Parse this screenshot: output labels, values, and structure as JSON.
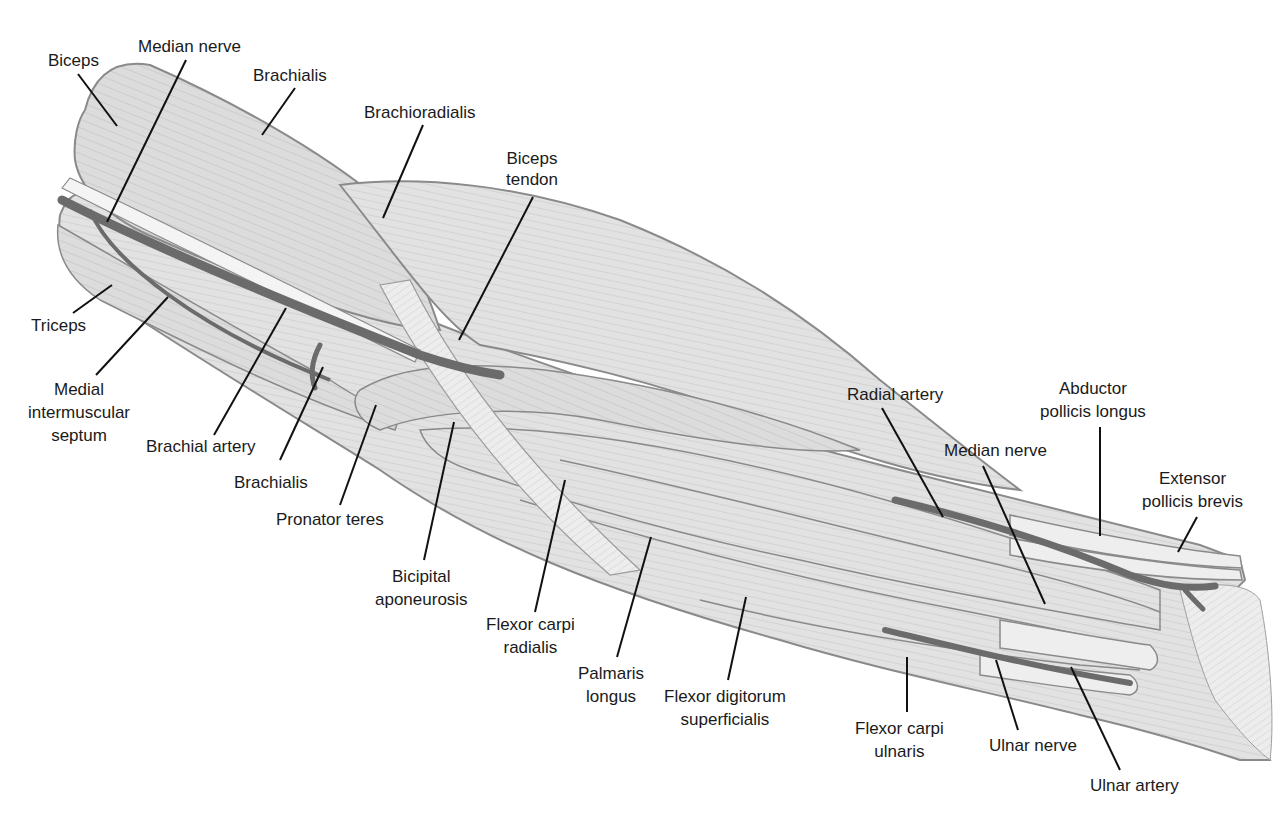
{
  "diagram": {
    "colors": {
      "background": "#ffffff",
      "muscle_fill": "#d9d9d9",
      "muscle_light": "#ececec",
      "muscle_outline": "#8a8a8a",
      "fiber_line": "#b5b5b5",
      "vessel": "#6b6b6b",
      "nerve": "#f2f2f2",
      "leader_line": "#111111",
      "text": "#1a1a1a"
    }
  },
  "labels": {
    "biceps": "Biceps",
    "median_nerve_top": "Median nerve",
    "brachialis_top": "Brachialis",
    "brachioradialis": "Brachioradialis",
    "biceps_tendon": "Biceps\ntendon",
    "triceps": "Triceps",
    "medial_intermuscular_septum": "Medial\nintermuscular\nseptum",
    "brachial_artery": "Brachial artery",
    "brachialis_bottom": "Brachialis",
    "pronator_teres": "Pronator teres",
    "bicipital_aponeurosis": "Bicipital\naponeurosis",
    "flexor_carpi_radialis": "Flexor carpi\nradialis",
    "palmaris_longus": "Palmaris\nlongus",
    "flexor_digitorum_superficialis": "Flexor digitorum\nsuperficialis",
    "flexor_carpi_ulnaris": "Flexor carpi\nulnaris",
    "radial_artery": "Radial artery",
    "median_nerve_right": "Median nerve",
    "abductor_pollicis_longus": "Abductor\npollicis longus",
    "extensor_pollicis_brevis": "Extensor\npollicis brevis",
    "ulnar_nerve": "Ulnar nerve",
    "ulnar_artery": "Ulnar artery"
  }
}
